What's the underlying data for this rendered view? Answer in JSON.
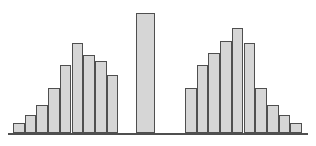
{
  "chart_data": {
    "type": "bar",
    "title": "",
    "subtitle": "",
    "xlabel": "",
    "ylabel": "",
    "grid": false,
    "legend": null,
    "axis": {
      "x_ticks": [],
      "y_ticks": [],
      "xlim": [
        0,
        27
      ],
      "ylim": [
        0,
        120
      ]
    },
    "annotations": [],
    "style": {
      "bar_fill": "#d6d6d6",
      "bar_border": "#4f4f4f",
      "baseline_color": "#4f4f4f",
      "background": "#ffffff"
    },
    "groups": [
      {
        "name": "left-cluster",
        "bar_count": 9,
        "values": [
          10,
          18,
          28,
          45,
          68,
          90,
          78,
          72,
          58
        ]
      },
      {
        "name": "center-bar",
        "bar_count": 1,
        "values": [
          120
        ]
      },
      {
        "name": "right-cluster",
        "bar_count": 9,
        "values": [
          45,
          68,
          80,
          92,
          105,
          90,
          45,
          28,
          18
        ]
      }
    ],
    "categories": [
      "1",
      "2",
      "3",
      "4",
      "5",
      "6",
      "7",
      "8",
      "9",
      "gap",
      "10",
      "gap",
      "11",
      "12",
      "13",
      "14",
      "15",
      "16",
      "17",
      "18",
      "19"
    ],
    "values": [
      10,
      18,
      28,
      45,
      68,
      90,
      78,
      72,
      58,
      null,
      120,
      null,
      45,
      68,
      80,
      92,
      105,
      90,
      45,
      28,
      18
    ],
    "bars": [
      {
        "name": "bar-l1",
        "x": 13.0,
        "width": 11.7,
        "value": 10,
        "height": 10
      },
      {
        "name": "bar-l2",
        "x": 24.7,
        "width": 11.7,
        "value": 18,
        "height": 18
      },
      {
        "name": "bar-l3",
        "x": 36.4,
        "width": 11.7,
        "value": 28,
        "height": 28
      },
      {
        "name": "bar-l4",
        "x": 48.1,
        "width": 11.7,
        "value": 45,
        "height": 45
      },
      {
        "name": "bar-l5",
        "x": 59.8,
        "width": 11.7,
        "value": 68,
        "height": 68
      },
      {
        "name": "bar-l6",
        "x": 71.5,
        "width": 11.7,
        "value": 90,
        "height": 90
      },
      {
        "name": "bar-l7",
        "x": 83.2,
        "width": 11.7,
        "value": 78,
        "height": 78
      },
      {
        "name": "bar-l8",
        "x": 94.9,
        "width": 11.7,
        "value": 72,
        "height": 72
      },
      {
        "name": "bar-l9",
        "x": 106.6,
        "width": 11.7,
        "value": 58,
        "height": 58
      },
      {
        "name": "bar-center",
        "x": 136.0,
        "width": 19.0,
        "value": 120,
        "height": 120
      },
      {
        "name": "bar-r1",
        "x": 185.0,
        "width": 11.7,
        "value": 45,
        "height": 45
      },
      {
        "name": "bar-r2",
        "x": 196.7,
        "width": 11.7,
        "value": 68,
        "height": 68
      },
      {
        "name": "bar-r3",
        "x": 208.4,
        "width": 11.7,
        "value": 80,
        "height": 80
      },
      {
        "name": "bar-r4",
        "x": 220.1,
        "width": 11.7,
        "value": 92,
        "height": 92
      },
      {
        "name": "bar-r5",
        "x": 231.8,
        "width": 11.7,
        "value": 105,
        "height": 105
      },
      {
        "name": "bar-r6",
        "x": 243.5,
        "width": 11.7,
        "value": 90,
        "height": 90
      },
      {
        "name": "bar-r7",
        "x": 255.2,
        "width": 11.7,
        "value": 45,
        "height": 45
      },
      {
        "name": "bar-r8",
        "x": 266.9,
        "width": 11.7,
        "value": 28,
        "height": 28
      },
      {
        "name": "bar-r9",
        "x": 278.6,
        "width": 11.7,
        "value": 18,
        "height": 18
      },
      {
        "name": "bar-r10",
        "x": 290.3,
        "width": 11.7,
        "value": 10,
        "height": 10
      }
    ],
    "baseline": {
      "x": 8,
      "y": 133,
      "width": 300,
      "thickness": 1.6
    }
  }
}
